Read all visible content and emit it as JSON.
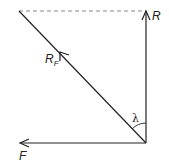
{
  "diagram": {
    "type": "force-vector-triangle",
    "colors": {
      "line": "#222222",
      "dashed": "#888888",
      "background": "#ffffff"
    },
    "vectors": [
      {
        "id": "R",
        "label": "R",
        "direction": "up",
        "description": "vertical force vector"
      },
      {
        "id": "RF",
        "label": "R",
        "subscript": "F",
        "direction": "up-left diagonal",
        "description": "resultant force along diagonal"
      },
      {
        "id": "F",
        "label": "F",
        "direction": "left",
        "description": "horizontal force vector"
      }
    ],
    "angle": {
      "label": "λ",
      "between": [
        "R",
        "RF"
      ]
    },
    "dashed_line": {
      "description": "horizontal dashed line completing rectangle top"
    }
  }
}
